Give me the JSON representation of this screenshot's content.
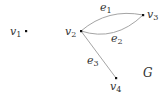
{
  "graph": {
    "name": "G",
    "colors": {
      "edge": "#9a9a9a",
      "vertex": "#111111",
      "text": "#333333"
    },
    "vertices": [
      {
        "id": "v1",
        "base": "v",
        "sub": "1",
        "x": 26,
        "y": 31
      },
      {
        "id": "v2",
        "base": "v",
        "sub": "2",
        "x": 81,
        "y": 31
      },
      {
        "id": "v3",
        "base": "v",
        "sub": "3",
        "x": 143,
        "y": 15
      },
      {
        "id": "v4",
        "base": "v",
        "sub": "4",
        "x": 116,
        "y": 78
      }
    ],
    "edges": [
      {
        "id": "e1",
        "base": "e",
        "sub": "1",
        "from": "v2",
        "to": "v3",
        "shape": "arc-upper"
      },
      {
        "id": "e2",
        "base": "e",
        "sub": "2",
        "from": "v2",
        "to": "v3",
        "shape": "arc-lower"
      },
      {
        "id": "e3",
        "base": "e",
        "sub": "3",
        "from": "v2",
        "to": "v4",
        "shape": "straight"
      }
    ]
  }
}
